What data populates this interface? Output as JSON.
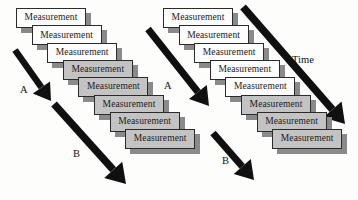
{
  "diagram": {
    "box_label": "Measurement",
    "colors": {
      "box_white": "#fdfdfd",
      "box_gray": "#c3c3c3",
      "box_border": "#2b2b2b",
      "shadow": "#8a8a8a",
      "arrow": "#101010",
      "background": "#fdfdfc"
    },
    "geometry": {
      "box_width": 70,
      "box_height": 20,
      "step_x": 15.6,
      "step_y": 17.3,
      "shadow_offset_x": 5,
      "shadow_offset_y": 5
    },
    "stacks": [
      {
        "name": "left-stack",
        "origin_x": 16,
        "origin_y": 8,
        "white_count": 3,
        "gray_count": 5,
        "boxes": [
          {
            "index": 1,
            "label": "Measurement",
            "fill": "white"
          },
          {
            "index": 2,
            "label": "Measurement",
            "fill": "white"
          },
          {
            "index": 3,
            "label": "Measurement",
            "fill": "white"
          },
          {
            "index": 4,
            "label": "Measurement",
            "fill": "gray"
          },
          {
            "index": 5,
            "label": "Measurement",
            "fill": "gray"
          },
          {
            "index": 6,
            "label": "Measurement",
            "fill": "gray"
          },
          {
            "index": 7,
            "label": "Measurement",
            "fill": "gray"
          },
          {
            "index": 8,
            "label": "Measurement",
            "fill": "gray"
          }
        ]
      },
      {
        "name": "right-stack",
        "origin_x": 163,
        "origin_y": 8,
        "white_count": 5,
        "gray_count": 3,
        "boxes": [
          {
            "index": 1,
            "label": "Measurement",
            "fill": "white"
          },
          {
            "index": 2,
            "label": "Measurement",
            "fill": "white"
          },
          {
            "index": 3,
            "label": "Measurement",
            "fill": "white"
          },
          {
            "index": 4,
            "label": "Measurement",
            "fill": "white"
          },
          {
            "index": 5,
            "label": "Measurement",
            "fill": "white"
          },
          {
            "index": 6,
            "label": "Measurement",
            "fill": "gray"
          },
          {
            "index": 7,
            "label": "Measurement",
            "fill": "gray"
          },
          {
            "index": 8,
            "label": "Measurement",
            "fill": "gray"
          }
        ]
      }
    ],
    "arrows": [
      {
        "name": "left-arrow-a",
        "label": "A",
        "label_x": 20,
        "label_y": 84,
        "x1": 15,
        "y1": 50,
        "x2": 51,
        "y2": 101,
        "thickness": 6.5
      },
      {
        "name": "left-arrow-b",
        "label": "B",
        "label_x": 73,
        "label_y": 148,
        "x1": 54,
        "y1": 104,
        "x2": 126,
        "y2": 184,
        "thickness": 7.5
      },
      {
        "name": "right-arrow-a",
        "label": "A",
        "label_x": 164,
        "label_y": 80,
        "x1": 148,
        "y1": 29,
        "x2": 209,
        "y2": 106,
        "thickness": 7
      },
      {
        "name": "right-arrow-b",
        "label": "B",
        "label_x": 222,
        "label_y": 155,
        "x1": 213,
        "y1": 133,
        "x2": 254,
        "y2": 180,
        "thickness": 7
      },
      {
        "name": "time-arrow",
        "label": "Time",
        "label_x": 292,
        "label_y": 54,
        "x1": 243,
        "y1": 7,
        "x2": 345,
        "y2": 124,
        "thickness": 7.5
      }
    ]
  }
}
